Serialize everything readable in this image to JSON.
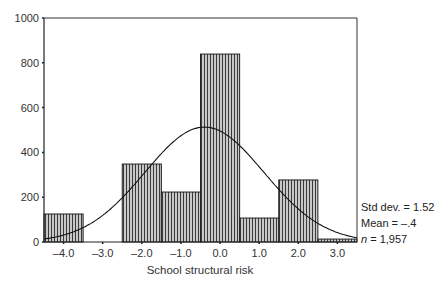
{
  "chart_data": {
    "type": "bar",
    "subtype": "histogram with normal curve",
    "title": "",
    "xlabel": "School structural risk",
    "ylabel": "",
    "bin_edges": [
      -4.5,
      -3.5,
      -2.5,
      -1.5,
      -0.5,
      0.5,
      1.5,
      2.5,
      3.5
    ],
    "categories": [
      "-4.0",
      "-3.0",
      "-2.0",
      "-1.0",
      "0.0",
      "1.0",
      "2.0",
      "3.0"
    ],
    "values": [
      125,
      0,
      348,
      223,
      839,
      107,
      277,
      13
    ],
    "x_ticks": [
      "-4.0",
      "-3.0",
      "-2.0",
      "-1.0",
      "0.0",
      "1.0",
      "2.0",
      "3.0"
    ],
    "x_tick_values": [
      -4,
      -3,
      -2,
      -1,
      0,
      1,
      2,
      3
    ],
    "y_ticks": [
      "0",
      "200",
      "400",
      "600",
      "800",
      "1000"
    ],
    "y_tick_values": [
      0,
      200,
      400,
      600,
      800,
      1000
    ],
    "xlim": [
      -4.5,
      3.5
    ],
    "ylim": [
      0,
      1000
    ],
    "grid": false,
    "legend": null,
    "normal_curve": {
      "mean": -0.4,
      "std": 1.52,
      "n": 1957,
      "peak": 513
    },
    "annotations": [
      "Std dev. = 1.52",
      "Mean = –.4",
      "n = 1,957"
    ]
  },
  "stats": {
    "std": "Std dev. = 1.52",
    "mean": "Mean = –.4",
    "n_label": "n",
    "n_value": " = 1,957"
  },
  "colors": {
    "bar_fill": "#9a9a9a",
    "bar_stripe": "#444444",
    "axis": "#222222"
  }
}
